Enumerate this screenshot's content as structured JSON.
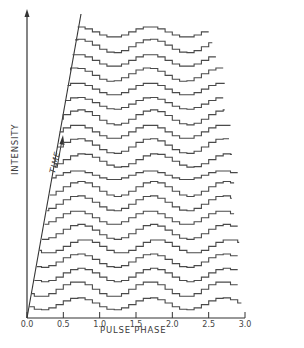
{
  "chart_data": {
    "type": "line",
    "subtype": "stacked-waterfall-step",
    "title": "",
    "xlabel": "PULSE PHASE",
    "ylabel": "INTENSITY",
    "time_axis_label": "TIME",
    "xlim": [
      0.0,
      3.0
    ],
    "xticks": [
      "0.0",
      "0.5",
      "1.0",
      "1.5",
      "2.0",
      "2.5",
      "3.0"
    ],
    "grid": false,
    "legend": null,
    "n_traces": 20,
    "bins_per_cycle": 10,
    "cycles": 3,
    "trace_phase_of_peak": [
      0.72,
      0.7,
      0.75,
      0.73,
      0.8,
      0.74,
      0.7,
      0.72,
      0.75,
      0.7,
      0.78,
      0.72,
      0.7,
      0.74,
      0.72,
      0.7,
      0.68,
      0.7,
      0.72,
      0.7
    ],
    "trace_amplitude": [
      0.8,
      1.0,
      0.9,
      0.9,
      0.9,
      1.0,
      0.9,
      1.0,
      1.0,
      0.6,
      0.9,
      1.0,
      0.9,
      1.0,
      0.8,
      0.8,
      0.9,
      0.8,
      0.9,
      0.7
    ],
    "trace_end_phase": [
      2.95,
      2.9,
      2.9,
      2.9,
      2.92,
      2.9,
      2.85,
      2.82,
      2.85,
      2.9,
      2.82,
      2.78,
      2.8,
      2.72,
      2.7,
      2.72,
      2.7,
      2.6,
      2.55,
      2.5
    ]
  },
  "axes": {
    "x_axis": {
      "label": "PULSE PHASE"
    },
    "y_axis": {
      "label": "INTENSITY"
    },
    "time_axis": {
      "label": "TIME"
    }
  },
  "style": {
    "line_color": "#4a4a4a",
    "axis_color": "#333333",
    "background": "#ffffff"
  }
}
